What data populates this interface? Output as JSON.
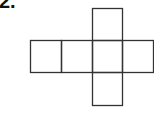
{
  "problem": {
    "label": "2."
  },
  "diagram": {
    "type": "cube-net",
    "stroke": "#333333",
    "squares": [
      {
        "x": 92,
        "y": 8,
        "w": 30,
        "h": 32
      },
      {
        "x": 30,
        "y": 40,
        "w": 31,
        "h": 32
      },
      {
        "x": 61,
        "y": 40,
        "w": 31,
        "h": 32
      },
      {
        "x": 92,
        "y": 40,
        "w": 30,
        "h": 32
      },
      {
        "x": 122,
        "y": 40,
        "w": 31,
        "h": 32
      },
      {
        "x": 92,
        "y": 72,
        "w": 30,
        "h": 33
      }
    ]
  }
}
